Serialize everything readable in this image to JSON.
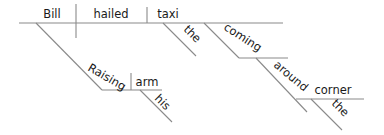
{
  "diagram": {
    "type": "sentence-diagram",
    "sentence": "Raising his arm, Bill hailed the taxi coming around the corner",
    "words": {
      "subject": "Bill",
      "verb": "hailed",
      "object": "taxi",
      "object_article": "the",
      "participle": "coming",
      "preposition": "around",
      "prep_object": "corner",
      "prep_object_article": "the",
      "subject_participle": "Raising",
      "participle_object": "arm",
      "participle_object_modifier": "his"
    }
  }
}
